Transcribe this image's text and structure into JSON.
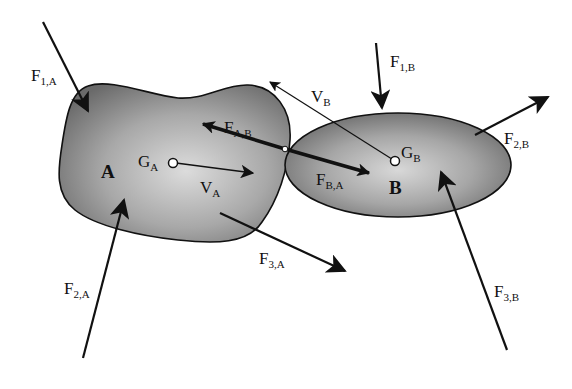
{
  "diagram": {
    "colors": {
      "background": "#ffffff",
      "body_fill_center": "#d8d8d8",
      "body_fill_edge": "#6e6e6e",
      "stroke": "#111111"
    },
    "bodies": [
      {
        "id": "A",
        "label": "A",
        "centroid_label": "G",
        "centroid_sub": "A",
        "velocity_label": "V",
        "velocity_sub": "A"
      },
      {
        "id": "B",
        "label": "B",
        "centroid_label": "G",
        "centroid_sub": "B",
        "velocity_label": "V",
        "velocity_sub": "B"
      }
    ],
    "forces": {
      "f1a": {
        "main": "F",
        "sub": "1,A"
      },
      "f2a": {
        "main": "F",
        "sub": "2,A"
      },
      "f3a": {
        "main": "F",
        "sub": "3,A"
      },
      "fab": {
        "main": "F",
        "sub": "A,B"
      },
      "fba": {
        "main": "F",
        "sub": "B,A"
      },
      "f1b": {
        "main": "F",
        "sub": "1,B"
      },
      "f2b": {
        "main": "F",
        "sub": "2,B"
      },
      "f3b": {
        "main": "F",
        "sub": "3,B"
      }
    }
  }
}
